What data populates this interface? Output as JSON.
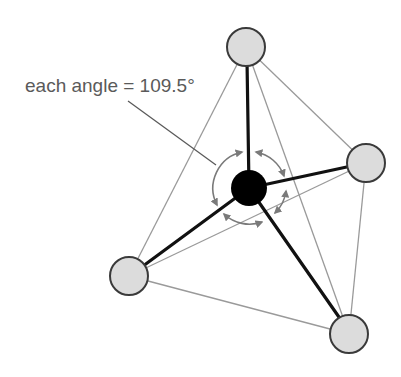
{
  "diagram": {
    "type": "tetrahedral-molecule",
    "label": "each angle = 109.5°",
    "label_pos": {
      "x": 25,
      "y": 92
    },
    "leader_line": {
      "x1": 128,
      "y1": 101,
      "x2": 216,
      "y2": 165
    },
    "colors": {
      "background": "#ffffff",
      "outer_atom_fill": "#dcdcdc",
      "outer_atom_stroke": "#3a3a3a",
      "central_atom": "#000000",
      "bond": "#111111",
      "edge": "#9a9a9a",
      "angle_arc": "#7a7a7a",
      "label": "#5a5a5a"
    },
    "central_atom": {
      "x": 249,
      "y": 188,
      "r": 18
    },
    "outer_atoms": [
      {
        "name": "top",
        "x": 246,
        "y": 47,
        "r": 19
      },
      {
        "name": "right",
        "x": 366,
        "y": 163,
        "r": 19
      },
      {
        "name": "left",
        "x": 129,
        "y": 276,
        "r": 19
      },
      {
        "name": "bottom",
        "x": 349,
        "y": 334,
        "r": 19
      }
    ],
    "angle_ring": {
      "x": 249,
      "y": 188,
      "r": 37
    }
  }
}
